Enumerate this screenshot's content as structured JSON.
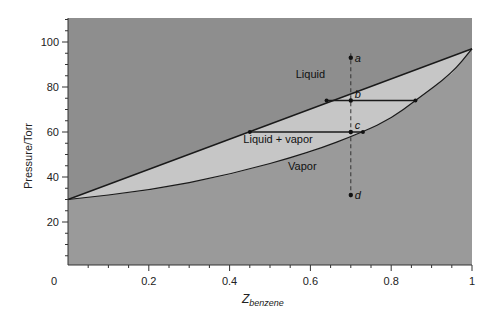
{
  "chart_data": {
    "type": "line",
    "title": "",
    "xlabel": "Z_benzene",
    "xlabel_main": "Z",
    "xlabel_sub": "benzene",
    "ylabel": "Pressure/Torr",
    "xlim": [
      0,
      1
    ],
    "ylim": [
      0,
      110
    ],
    "x_ticks": [
      "0",
      "0.2",
      "0.4",
      "0.6",
      "0.8",
      "1"
    ],
    "y_ticks": [
      "20",
      "40",
      "60",
      "80",
      "100"
    ],
    "grid": false,
    "series": [
      {
        "name": "Liquid line (bubble point)",
        "x": [
          0,
          1
        ],
        "y": [
          30,
          97
        ]
      },
      {
        "name": "Vapor line (dew point)",
        "x": [
          0,
          0.2,
          0.4,
          0.6,
          0.73,
          0.8,
          0.86,
          0.95,
          1
        ],
        "y": [
          30,
          34,
          41,
          51,
          60,
          66,
          74,
          86,
          97
        ]
      }
    ],
    "regions": [
      {
        "label": "Liquid",
        "x": 0.6,
        "y": 84
      },
      {
        "label": "Liquid + vapor",
        "x": 0.52,
        "y": 55
      },
      {
        "label": "Vapor",
        "x": 0.58,
        "y": 43
      }
    ],
    "points": [
      {
        "label": "a",
        "x": 0.7,
        "y": 93
      },
      {
        "label": "b",
        "x": 0.7,
        "y": 74
      },
      {
        "label": "c",
        "x": 0.7,
        "y": 60
      },
      {
        "label": "d",
        "x": 0.7,
        "y": 32
      }
    ],
    "tie_lines": [
      {
        "y": 74,
        "x_start": 0.64,
        "x_end": 0.86
      },
      {
        "y": 60,
        "x_start": 0.45,
        "x_end": 0.73
      }
    ],
    "isopleth": {
      "x": 0.7,
      "style": "dashed"
    },
    "colors": {
      "liquid_region": "#8e8e8e",
      "two_phase_region": "#c6c6c6",
      "vapor_region": "#9a9a9a",
      "line": "#1a1a1a"
    }
  }
}
